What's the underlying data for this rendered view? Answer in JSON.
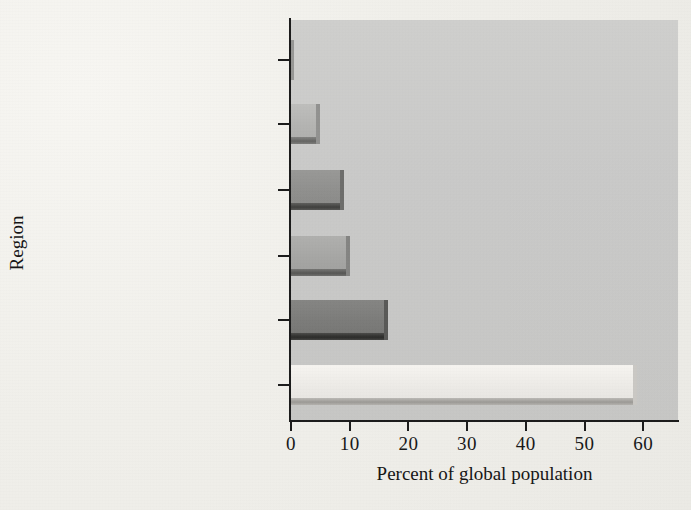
{
  "chart_data": {
    "type": "bar",
    "orientation": "horizontal",
    "title": "",
    "xlabel": "Percent of global population",
    "ylabel": "Region",
    "categories": [
      "Oceania",
      "North America",
      "South & Central America\n& Caribbean",
      "Europe",
      "Africa",
      "Asia"
    ],
    "values": [
      0.5,
      5,
      9,
      10,
      16.5,
      59
    ],
    "xlim": [
      0,
      62
    ],
    "xticks": [
      0,
      10,
      20,
      30,
      40,
      50,
      60
    ],
    "xtick_labels": [
      "0",
      "10",
      "20",
      "30",
      "40",
      "50",
      "60"
    ],
    "grid": false,
    "legend": false,
    "bar_colors": [
      "#b9b9b7",
      "#b4b4b2",
      "#8f8f8d",
      "#a6a6a4",
      "#7b7b79",
      "#eceae6"
    ],
    "plot_background": "#cdcdcb",
    "page_background": "#f2f1ed",
    "axis_color": "#1b1b1b"
  },
  "axes": {
    "x_title": "Percent of global population",
    "y_title": "Region"
  },
  "y_categories": [
    {
      "label": "Oceania",
      "line2": ""
    },
    {
      "label": "North America",
      "line2": ""
    },
    {
      "label": "South & Central America",
      "line2": "& Caribbean"
    },
    {
      "label": "Europe",
      "line2": ""
    },
    {
      "label": "Africa",
      "line2": ""
    },
    {
      "label": "Asia",
      "line2": ""
    }
  ],
  "x_tick_labels": [
    "0",
    "10",
    "20",
    "30",
    "40",
    "50",
    "60"
  ]
}
